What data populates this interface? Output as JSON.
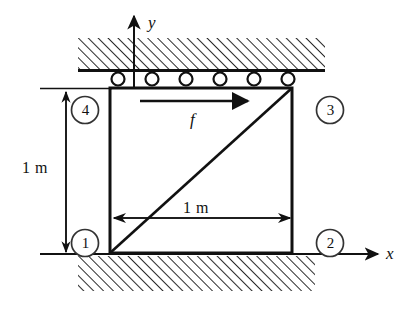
{
  "figure": {
    "title": "",
    "type": "engineering-mechanics-diagram",
    "colors": {
      "line": "#111111",
      "hatch": "#2b2b2b",
      "background": "#ffffff",
      "node_circle": "#333333"
    },
    "axes": {
      "x_label": "x",
      "y_label": "y",
      "origin": {
        "x": 110,
        "y": 253
      }
    },
    "nodes": [
      {
        "id": "1",
        "label": "1",
        "x": 110,
        "y": 253,
        "label_x": 78,
        "label_y": 237
      },
      {
        "id": "2",
        "label": "2",
        "x": 292,
        "y": 253,
        "label_x": 322,
        "label_y": 237
      },
      {
        "id": "3",
        "label": "3",
        "x": 292,
        "y": 88,
        "label_x": 322,
        "label_y": 104
      },
      {
        "id": "4",
        "label": "4",
        "x": 110,
        "y": 88,
        "label_x": 78,
        "label_y": 104
      }
    ],
    "force": {
      "label": "f",
      "direction": "right",
      "start_x": 140,
      "end_x": 245,
      "y": 101,
      "label_x": 192,
      "label_y": 116
    },
    "dimensions": [
      {
        "name": "vertical-height",
        "label": "1 m",
        "orientation": "vertical",
        "label_x": 26,
        "label_y": 160
      },
      {
        "name": "horizontal-width",
        "label": "1 m",
        "orientation": "horizontal",
        "label_x": 183,
        "label_y": 207
      }
    ],
    "supports": {
      "top": {
        "name": "roller-support",
        "roller_count": 6,
        "roller_radius": 6.5,
        "roller_y": 79,
        "roller_xs": [
          118,
          152,
          186,
          220,
          254,
          288
        ]
      },
      "bottom": {
        "name": "fixed-support",
        "hatch_label": "ground-hatching"
      }
    },
    "element": {
      "name": "quad-element",
      "diagonal": "node1-to-node3",
      "left": 110,
      "right": 292,
      "top": 88,
      "bottom": 253
    }
  }
}
